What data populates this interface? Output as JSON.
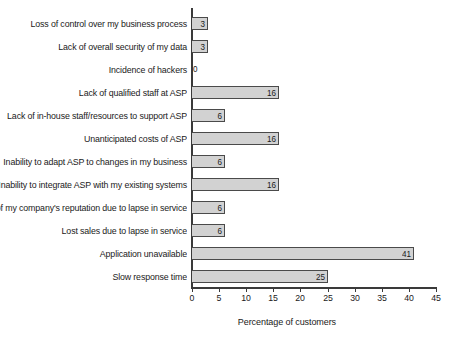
{
  "chart_data": {
    "type": "bar",
    "orientation": "horizontal",
    "title": "",
    "xlabel": "Percentage of customers",
    "ylabel": "",
    "xlim": [
      0,
      45
    ],
    "xticks": [
      0,
      5,
      10,
      15,
      20,
      25,
      30,
      35,
      40,
      45
    ],
    "grid": false,
    "legend": null,
    "bar_fill_color": "#d2d2d2",
    "bar_border_color": "#4a4a4a",
    "axis_color": "#3a3a3a",
    "background_color": "#ffffff",
    "value_labels": true,
    "categories": [
      "Loss of control over my business process",
      "Lack of overall security of my data",
      "Incidence of hackers",
      "Lack of qualified staff at ASP",
      "Lack of in-house staff/resources to support ASP",
      "Unanticipated costs of ASP",
      "Inability to adapt ASP to changes in my business",
      "Inability to integrate ASP with my existing systems",
      "Loss of my company's reputation due to lapse in service",
      "Lost sales due to lapse in service",
      "Application unavailable",
      "Slow response time"
    ],
    "values": [
      3,
      3,
      0,
      16,
      6,
      16,
      6,
      16,
      6,
      6,
      41,
      25
    ],
    "bars": [
      {
        "label": "Loss of control over my business process",
        "value": 3,
        "value_text": "3"
      },
      {
        "label": "Lack of overall security of my data",
        "value": 3,
        "value_text": "3"
      },
      {
        "label": "Incidence of hackers",
        "value": 0,
        "value_text": "0"
      },
      {
        "label": "Lack of qualified staff at ASP",
        "value": 16,
        "value_text": "16"
      },
      {
        "label": "Lack of in-house staff/resources to support ASP",
        "value": 6,
        "value_text": "6"
      },
      {
        "label": "Unanticipated costs of ASP",
        "value": 16,
        "value_text": "16"
      },
      {
        "label": "Inability to adapt ASP to changes in my business",
        "value": 6,
        "value_text": "6"
      },
      {
        "label": "Inability to integrate ASP with my existing systems",
        "value": 16,
        "value_text": "16"
      },
      {
        "label": "Loss of my company's reputation due to lapse in service",
        "value": 6,
        "value_text": "6"
      },
      {
        "label": "Lost sales due to lapse in service",
        "value": 6,
        "value_text": "6"
      },
      {
        "label": "Application unavailable",
        "value": 41,
        "value_text": "41"
      },
      {
        "label": "Slow response time",
        "value": 25,
        "value_text": "25"
      }
    ],
    "xtick_labels": [
      "0",
      "5",
      "10",
      "15",
      "20",
      "25",
      "30",
      "35",
      "40",
      "45"
    ]
  }
}
